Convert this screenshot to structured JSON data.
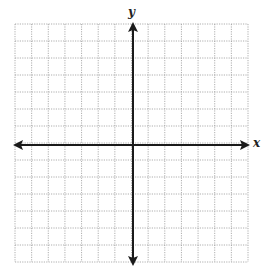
{
  "diagram": {
    "type": "coordinate-plane",
    "x_axis_label": "x",
    "y_axis_label": "y",
    "grid": {
      "columns": 14,
      "rows": 14,
      "style": "dotted",
      "color": "#9a9a9a"
    },
    "axis_color": "#1a1a1a",
    "arrows": [
      "left",
      "right",
      "up",
      "down"
    ]
  }
}
